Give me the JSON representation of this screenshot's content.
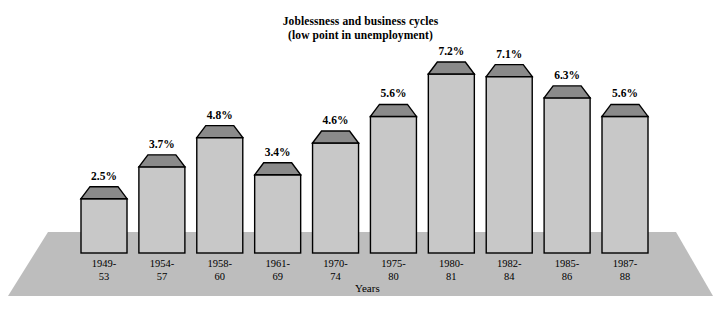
{
  "chart_data": {
    "type": "bar",
    "title": "Joblessness and business cycles",
    "subtitle": "(low point in unemployment)",
    "xlabel": "Years",
    "ylabel": "",
    "grid": false,
    "legend": "none",
    "ylim": [
      0,
      7.2
    ],
    "categories": [
      "1949-53",
      "1954-57",
      "1958-60",
      "1961-69",
      "1970-74",
      "1975-80",
      "1980-81",
      "1982-84",
      "1985-86",
      "1987-88"
    ],
    "category_lines": [
      [
        "1949-",
        "53"
      ],
      [
        "1954-",
        "57"
      ],
      [
        "1958-",
        "60"
      ],
      [
        "1961-",
        "69"
      ],
      [
        "1970-",
        "74"
      ],
      [
        "1975-",
        "80"
      ],
      [
        "1980-",
        "81"
      ],
      [
        "1982-",
        "84"
      ],
      [
        "1985-",
        "86"
      ],
      [
        "1987-",
        "88"
      ]
    ],
    "values": [
      2.5,
      3.7,
      4.8,
      3.4,
      4.6,
      5.6,
      7.2,
      7.1,
      6.3,
      5.6
    ],
    "value_labels": [
      "2.5%",
      "3.7%",
      "4.8%",
      "3.4%",
      "4.6%",
      "5.6%",
      "7.2%",
      "7.1%",
      "6.3%",
      "5.6%"
    ]
  },
  "style": {
    "bar_face": "#c8c8c8",
    "bar_top": "#8a8a8a",
    "base_plate": "#bdbdbd",
    "outline": "#000000",
    "background": "#ffffff"
  }
}
